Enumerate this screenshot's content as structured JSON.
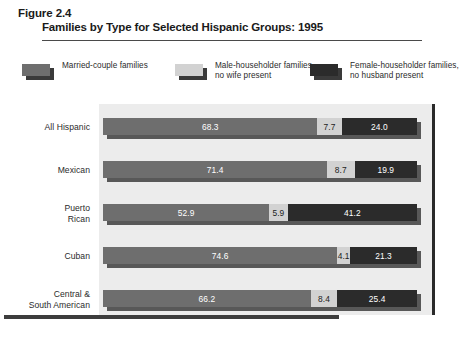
{
  "figure": {
    "number": "Figure 2.4",
    "title": "Families by Type for Selected Hispanic Groups: 1995"
  },
  "legend": {
    "items": [
      {
        "label": "Married-couple families",
        "color": "#6e6e6e",
        "key": "married"
      },
      {
        "label": "Male-householder families, no wife present",
        "color": "#d2d2d2",
        "key": "male"
      },
      {
        "label": "Female-householder families, no husband present",
        "color": "#2b2b2b",
        "key": "female"
      }
    ]
  },
  "chart_data": {
    "type": "bar",
    "orientation": "horizontal",
    "stacked": true,
    "stack_total": 100,
    "title": "Families by Type for Selected Hispanic Groups: 1995",
    "xlabel": "",
    "ylabel": "",
    "xlim": [
      0,
      100
    ],
    "grid": false,
    "legend_position": "top",
    "categories": [
      "All Hispanic",
      "Mexican",
      "Puerto Rican",
      "Cuban",
      "Central & South American"
    ],
    "series": [
      {
        "name": "Married-couple families",
        "color": "#6e6e6e",
        "values": [
          68.3,
          71.4,
          52.9,
          74.6,
          66.2
        ],
        "labels": [
          "68.3",
          "71.4",
          "52.9",
          "74.6",
          "66.2"
        ]
      },
      {
        "name": "Male-householder families, no wife present",
        "color": "#d2d2d2",
        "values": [
          7.7,
          8.7,
          5.9,
          4.1,
          8.4
        ],
        "labels": [
          "7.7",
          "8.7",
          "5.9",
          "4.1",
          "8.4"
        ]
      },
      {
        "name": "Female-householder families, no husband present",
        "color": "#2b2b2b",
        "values": [
          24.0,
          19.9,
          41.2,
          21.3,
          25.4
        ],
        "labels": [
          "24.0",
          "19.9",
          "41.2",
          "21.3",
          "25.4"
        ]
      }
    ]
  },
  "rows": [
    {
      "label_lines": [
        "All Hispanic"
      ],
      "segments": [
        {
          "key": "married",
          "value": 68.3,
          "label": "68.3"
        },
        {
          "key": "male",
          "value": 7.7,
          "label": "7.7"
        },
        {
          "key": "female",
          "value": 24.0,
          "label": "24.0"
        }
      ]
    },
    {
      "label_lines": [
        "Mexican"
      ],
      "segments": [
        {
          "key": "married",
          "value": 71.4,
          "label": "71.4"
        },
        {
          "key": "male",
          "value": 8.7,
          "label": "8.7"
        },
        {
          "key": "female",
          "value": 19.9,
          "label": "19.9"
        }
      ]
    },
    {
      "label_lines": [
        "Puerto",
        "Rican"
      ],
      "segments": [
        {
          "key": "married",
          "value": 52.9,
          "label": "52.9"
        },
        {
          "key": "male",
          "value": 5.9,
          "label": "5.9"
        },
        {
          "key": "female",
          "value": 41.2,
          "label": "41.2"
        }
      ]
    },
    {
      "label_lines": [
        "Cuban"
      ],
      "segments": [
        {
          "key": "married",
          "value": 74.6,
          "label": "74.6"
        },
        {
          "key": "male",
          "value": 4.1,
          "label": "4.1"
        },
        {
          "key": "female",
          "value": 21.3,
          "label": "21.3"
        }
      ]
    },
    {
      "label_lines": [
        "Central &",
        "South American"
      ],
      "segments": [
        {
          "key": "married",
          "value": 66.2,
          "label": "66.2"
        },
        {
          "key": "male",
          "value": 8.4,
          "label": "8.4"
        },
        {
          "key": "female",
          "value": 25.4,
          "label": "25.4"
        }
      ]
    }
  ]
}
